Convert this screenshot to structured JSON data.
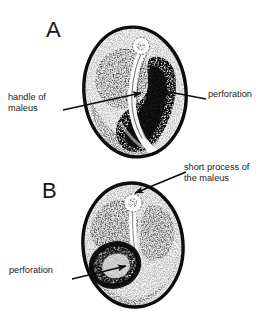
{
  "figure": {
    "type": "medical-illustration",
    "background_color": "#ffffff",
    "ink_color": "#101010",
    "panels": [
      {
        "id": "A",
        "letter": "A",
        "labels": [
          {
            "id": "handle-of-maleus",
            "text": "handle of\nmaleus"
          },
          {
            "id": "perforation-a",
            "text": "perforation"
          }
        ]
      },
      {
        "id": "B",
        "letter": "B",
        "labels": [
          {
            "id": "short-process",
            "text": "short process of\nthe maleus"
          },
          {
            "id": "perforation-b",
            "text": "perforation"
          }
        ]
      }
    ]
  },
  "panel_a": {
    "letter": "A",
    "label_handle": "handle of\nmaleus",
    "label_perforation": "perforation"
  },
  "panel_b": {
    "letter": "B",
    "label_short_process": "short process of\nthe maleus",
    "label_perforation": "perforation"
  }
}
